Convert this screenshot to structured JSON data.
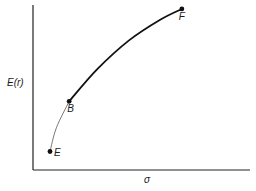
{
  "chart_data": {
    "type": "line",
    "title": "",
    "xlabel": "σ",
    "ylabel": "E(r)",
    "grid": false,
    "legend": "none",
    "xlim": [
      0,
      10
    ],
    "ylim": [
      0,
      10
    ],
    "series": [
      {
        "name": "E-B segment",
        "style": "thin",
        "x": [
          0.8,
          1.1,
          1.7
        ],
        "y": [
          0.7,
          1.6,
          2.6
        ]
      },
      {
        "name": "B-F frontier",
        "style": "thick",
        "x": [
          1.7,
          3.0,
          4.5,
          6.0,
          7.0
        ],
        "y": [
          2.6,
          3.8,
          4.9,
          5.7,
          6.1
        ]
      }
    ],
    "points": [
      {
        "label": "E",
        "x": 0.8,
        "y": 0.7
      },
      {
        "label": "B",
        "x": 1.7,
        "y": 2.6
      },
      {
        "label": "F",
        "x": 7.0,
        "y": 6.1
      }
    ]
  }
}
